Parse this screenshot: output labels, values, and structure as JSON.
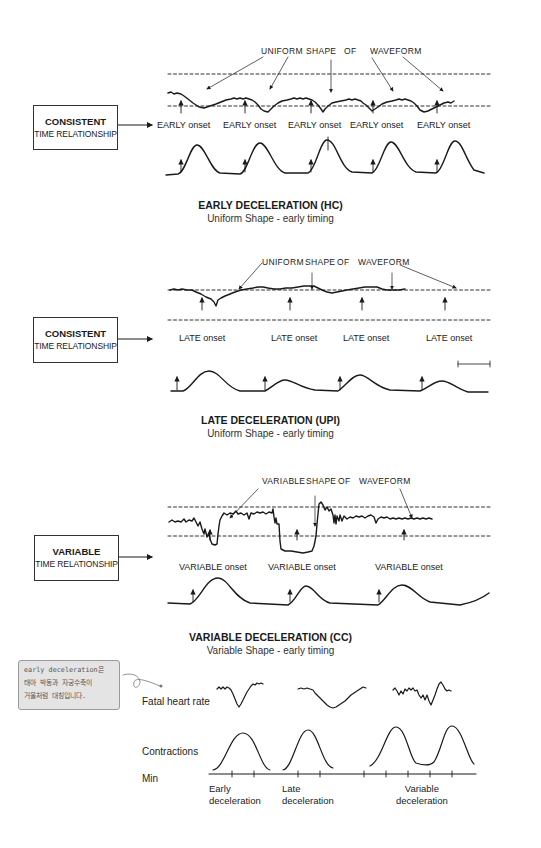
{
  "sections": [
    {
      "id": "early",
      "annotation": [
        "UNIFORM",
        "SHAPE",
        "OF",
        "WAVEFORM"
      ],
      "box": {
        "line1": "CONSISTENT",
        "line2": "TIME RELATIONSHIP"
      },
      "onset_labels": [
        "EARLY onset",
        "EARLY onset",
        "EARLY onset",
        "EARLY onset",
        "EARLY onset"
      ],
      "title": "EARLY DECELERATION (HC)",
      "subtitle": "Uniform Shape - early timing"
    },
    {
      "id": "late",
      "annotation": [
        "UNIFORM",
        "SHAPE",
        "OF",
        "WAVEFORM"
      ],
      "box": {
        "line1": "CONSISTENT",
        "line2": "TIME RELATIONSHIP"
      },
      "onset_labels": [
        "LATE onset",
        "LATE onset",
        "LATE onset",
        "LATE onset"
      ],
      "title": "LATE DECELERATION (UPI)",
      "subtitle": "Uniform Shape - early timing"
    },
    {
      "id": "variable",
      "annotation": [
        "VARIABLE",
        "SHAPE",
        "OF",
        "WAVEFORM"
      ],
      "box": {
        "line1": "VARIABLE",
        "line2": "TIME RELATIONSHIP"
      },
      "onset_labels": [
        "VARIABLE onset",
        "VARIABLE onset",
        "VARIABLE onset"
      ],
      "title": "VARIABLE DECELERATION (CC)",
      "subtitle": "Variable Shape - early timing"
    }
  ],
  "summary": {
    "note_lines": [
      "early deceleration은",
      "태아 박동과 자궁수축이",
      "거울처럼 대칭입니다."
    ],
    "row_labels": {
      "fhr": "Fatal heart rate",
      "contractions": "Contractions",
      "min": "Min"
    },
    "axis_labels": [
      {
        "line1": "Early",
        "line2": "deceleration"
      },
      {
        "line1": "Late",
        "line2": "deceleration"
      },
      {
        "line1": "Variable",
        "line2": "deceleration"
      }
    ]
  },
  "colors": {
    "ink": "#1a1a1a",
    "note_bg": "#e4e4e4",
    "background": "#ffffff"
  }
}
